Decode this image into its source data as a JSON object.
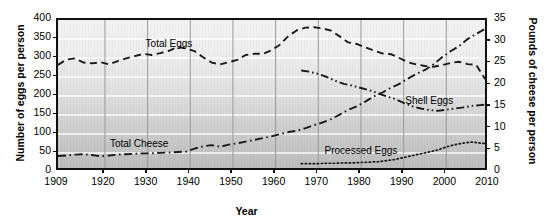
{
  "chart_data": {
    "type": "line",
    "title": "",
    "xlabel": "Year",
    "ylabel": "Number of eggs per person",
    "ylabel_secondary": "Pounds of cheese per person",
    "xlim": [
      1909,
      2010
    ],
    "ylim": [
      0,
      400
    ],
    "ylim_secondary": [
      0,
      35
    ],
    "xticks": [
      "1909",
      "1920",
      "1930",
      "1940",
      "1950",
      "1960",
      "1970",
      "1980",
      "1990",
      "2000",
      "2010"
    ],
    "xtick_values": [
      1909,
      1920,
      1930,
      1940,
      1950,
      1960,
      1970,
      1980,
      1990,
      2000,
      2010
    ],
    "yticks": [
      "0",
      "50",
      "100",
      "150",
      "200",
      "250",
      "300",
      "350",
      "400"
    ],
    "ytick_values": [
      0,
      50,
      100,
      150,
      200,
      250,
      300,
      350,
      400
    ],
    "yticks_secondary": [
      "0",
      "5",
      "10",
      "15",
      "20",
      "25",
      "30",
      "35"
    ],
    "ytick_values_secondary": [
      0,
      5,
      10,
      15,
      20,
      25,
      30,
      35
    ],
    "grid": true,
    "legend": "inline-labels",
    "series": [
      {
        "name": "Total Eggs",
        "axis": "left",
        "linestyle": "dashed",
        "color": "#1a1a1a",
        "label_x": 1935,
        "label_y": 335,
        "x": [
          1909,
          1911,
          1913,
          1915,
          1917,
          1919,
          1921,
          1923,
          1925,
          1927,
          1929,
          1931,
          1933,
          1935,
          1937,
          1939,
          1941,
          1943,
          1945,
          1947,
          1949,
          1951,
          1953,
          1955,
          1957,
          1959,
          1961,
          1963,
          1965,
          1967,
          1969,
          1971,
          1973,
          1975,
          1977,
          1979,
          1981,
          1983,
          1985,
          1987,
          1989,
          1991,
          1993,
          1995,
          1997,
          1999,
          2001,
          2003,
          2005,
          2007,
          2009,
          2010
        ],
        "y": [
          282,
          296,
          299,
          288,
          286,
          289,
          283,
          292,
          299,
          305,
          311,
          308,
          313,
          319,
          329,
          325,
          318,
          302,
          288,
          283,
          289,
          295,
          308,
          311,
          311,
          320,
          335,
          358,
          373,
          380,
          381,
          378,
          372,
          357,
          341,
          337,
          328,
          320,
          312,
          310,
          300,
          289,
          283,
          279,
          277,
          281,
          287,
          290,
          284,
          282,
          246,
          247
        ]
      },
      {
        "name": "Total Cheese",
        "axis": "right",
        "linestyle": "dashdot",
        "color": "#1a1a1a",
        "label_x": 1928,
        "label_y_right": 6.3,
        "x": [
          1909,
          1911,
          1913,
          1915,
          1917,
          1919,
          1921,
          1923,
          1925,
          1927,
          1929,
          1931,
          1933,
          1935,
          1937,
          1939,
          1941,
          1943,
          1945,
          1947,
          1949,
          1951,
          1953,
          1955,
          1957,
          1959,
          1961,
          1963,
          1965,
          1967,
          1969,
          1971,
          1973,
          1975,
          1977,
          1979,
          1981,
          1983,
          1985,
          1987,
          1989,
          1991,
          1993,
          1995,
          1997,
          1999,
          2001,
          2003,
          2005,
          2007,
          2009,
          2010
        ],
        "y": [
          3.7,
          3.8,
          4.0,
          4.1,
          3.9,
          3.6,
          3.8,
          4.0,
          4.1,
          4.2,
          4.3,
          4.3,
          4.4,
          4.5,
          4.6,
          4.7,
          5.4,
          5.9,
          6.2,
          5.8,
          6.3,
          6.6,
          7.0,
          7.4,
          7.8,
          8.2,
          8.7,
          9.2,
          9.5,
          10.1,
          10.8,
          11.4,
          12.2,
          13.2,
          14.3,
          15.1,
          16.2,
          17.4,
          18.3,
          19.4,
          20.3,
          21.5,
          22.6,
          23.5,
          24.8,
          26.4,
          27.8,
          29.0,
          30.6,
          31.8,
          32.9,
          33.0
        ]
      },
      {
        "name": "Shell Eggs",
        "axis": "left",
        "linestyle": "dashdotdot",
        "color": "#1a1a1a",
        "label_x": 1996,
        "label_y": 183,
        "x": [
          1966,
          1968,
          1970,
          1972,
          1974,
          1976,
          1978,
          1980,
          1982,
          1984,
          1986,
          1988,
          1990,
          1992,
          1994,
          1996,
          1998,
          2000,
          2002,
          2004,
          2006,
          2008,
          2010
        ],
        "y": [
          267,
          264,
          258,
          250,
          240,
          232,
          227,
          221,
          215,
          207,
          199,
          192,
          182,
          173,
          167,
          163,
          161,
          164,
          167,
          170,
          174,
          176,
          178
        ]
      },
      {
        "name": "Processed Eggs",
        "axis": "left",
        "linestyle": "dotted",
        "color": "#1a1a1a",
        "label_x": 1980,
        "label_y": 52,
        "x": [
          1966,
          1968,
          1970,
          1972,
          1974,
          1976,
          1978,
          1980,
          1982,
          1984,
          1986,
          1988,
          1990,
          1992,
          1994,
          1996,
          1998,
          2000,
          2002,
          2004,
          2006,
          2008,
          2010
        ],
        "y": [
          22,
          22,
          22,
          23,
          23,
          24,
          24,
          25,
          26,
          27,
          30,
          33,
          38,
          43,
          48,
          53,
          58,
          66,
          72,
          76,
          79,
          76,
          74
        ]
      }
    ]
  }
}
